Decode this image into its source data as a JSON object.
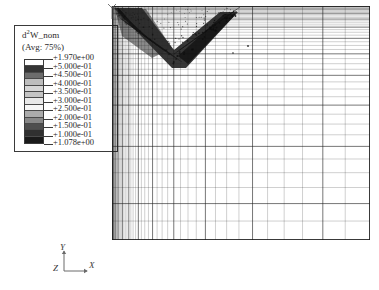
{
  "legend": {
    "title": "d",
    "title_sup": "2",
    "title_rest": "W_nom",
    "avg_label": "(Avg: 75%)",
    "values": [
      "+1.970e+00",
      "+5.000e-01",
      "+4.500e-01",
      "+4.000e-01",
      "+3.500e-01",
      "+3.000e-01",
      "+2.500e-01",
      "+2.000e-01",
      "+1.500e-01",
      "+1.000e-01",
      "+1.078e+00"
    ],
    "swatch_colors": [
      "#ffffff",
      "#3a3a3a",
      "#6e6e6e",
      "#b8b8b8",
      "#d2d2d2",
      "#c6c6c6",
      "#e4e4e4",
      "#f4f4f4",
      "#a9a9a9",
      "#8a8a8a",
      "#4a4a4a",
      "#2e2e2e",
      "#1c1c1c"
    ]
  },
  "triad": {
    "y_label": "Y",
    "x_label": "X",
    "z_label": "Z"
  },
  "chart_data": {
    "type": "mesh",
    "field_name": "d2W_nom",
    "averaging": "75%",
    "contour_levels": [
      1.97,
      0.5,
      0.45,
      0.4,
      0.35,
      0.3,
      0.25,
      0.2,
      0.15,
      0.1,
      1.078
    ],
    "legend_max": "+1.970e+00",
    "legend_min": "+1.078e+00",
    "mesh": {
      "x_columns": 46,
      "y_rows": 42,
      "grading": "geometric refinement toward the left edge in x and toward the top edge in y",
      "x_bias_ratio": 1.105,
      "y_bias_ratio": 1.085
    },
    "feature": {
      "shape": "V-shaped / chevron band of concentrated high values",
      "location": "upper portion of the domain near the top-left corner",
      "description": "Dense dark contour band forming an inverted chevron that starts at the upper-left corner, dips down toward mid-upper-left, then rises to the right"
    }
  }
}
